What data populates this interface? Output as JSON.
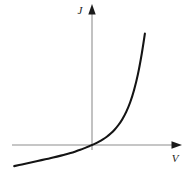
{
  "chart_data": {
    "type": "line",
    "title": "",
    "subtitle": "",
    "xlabel": "V",
    "ylabel": "J",
    "xlim": [
      -1.0,
      0.72
    ],
    "ylim": [
      -0.22,
      1.05
    ],
    "grid": false,
    "legend": null,
    "annotations": [],
    "series": [
      {
        "name": "J(V)",
        "color": "#141414",
        "x": [
          -1.0,
          -0.9,
          -0.8,
          -0.7,
          -0.6,
          -0.5,
          -0.4,
          -0.3,
          -0.22,
          -0.15,
          -0.08,
          -0.03,
          0.0,
          0.04,
          0.09,
          0.14,
          0.19,
          0.24,
          0.29,
          0.34,
          0.39,
          0.44,
          0.49,
          0.54,
          0.59,
          0.64,
          0.68
        ],
        "y": [
          -0.185,
          -0.17,
          -0.155,
          -0.14,
          -0.125,
          -0.11,
          -0.093,
          -0.074,
          -0.058,
          -0.042,
          -0.023,
          -0.009,
          0.0,
          0.012,
          0.029,
          0.049,
          0.072,
          0.1,
          0.134,
          0.175,
          0.226,
          0.29,
          0.372,
          0.479,
          0.618,
          0.8,
          0.975
        ]
      }
    ]
  },
  "axes": {
    "vertical": {
      "label": "J",
      "color": "#b3b3b3",
      "arrow_color": "#1a1a1a",
      "arrow_name": "up-arrow-icon"
    },
    "horizontal": {
      "label": "V",
      "color": "#b3b3b3",
      "arrow_color": "#1a1a1a",
      "arrow_name": "right-arrow-icon"
    }
  },
  "colors": {
    "background": "#ffffff",
    "curve": "#141414",
    "axis": "#b3b3b3",
    "label": "#1a1a1a"
  }
}
